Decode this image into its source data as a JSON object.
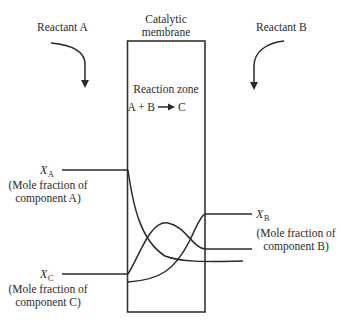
{
  "reactants": {
    "a": {
      "label": "Reactant A",
      "arrow": "curved-down-arrow"
    },
    "b": {
      "label": "Reactant B",
      "arrow": "curved-down-arrow"
    }
  },
  "membrane": {
    "label_line1": "Catalytic",
    "label_line2": "membrane",
    "zone_label": "Reaction zone",
    "reaction": {
      "lhs": "A + B",
      "rhs": "C"
    }
  },
  "components": {
    "a": {
      "symbol": "X",
      "subscript": "A",
      "desc_line1": "(Mole fraction of",
      "desc_line2": "component A)"
    },
    "b": {
      "symbol": "X",
      "subscript": "B",
      "desc_line1": "(Mole fraction of",
      "desc_line2": "component B)"
    },
    "c": {
      "symbol": "X",
      "subscript": "C",
      "desc_line1": "(Mole fraction of",
      "desc_line2": "component C)"
    }
  },
  "colors": {
    "ink": "#2b2b2b",
    "background": "#ffffff"
  }
}
